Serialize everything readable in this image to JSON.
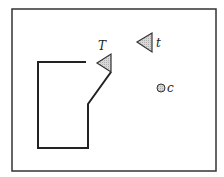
{
  "diagram": {
    "frame": {
      "x": 12,
      "y": 9,
      "w": 204,
      "h": 162,
      "stroke": "#333333"
    },
    "path": {
      "points": "86,62 38,62 38,148 88,148 88,104 111,72",
      "stroke": "#222222"
    },
    "shapes": [
      {
        "id": "T",
        "type": "triangle",
        "points": "97,63 111,54 111,72",
        "fill": "#cfcfcf",
        "label": "T",
        "label_x": 98,
        "label_y": 50
      },
      {
        "id": "t",
        "type": "triangle",
        "points": "137,42 152,33 152,52",
        "fill": "#cfcfcf",
        "label": "t",
        "label_x": 156,
        "label_y": 47
      },
      {
        "id": "c",
        "type": "circle",
        "cx": 161,
        "cy": 88,
        "r": 4,
        "fill": "#cfcfcf",
        "label": "c",
        "label_x": 167,
        "label_y": 92
      }
    ]
  }
}
